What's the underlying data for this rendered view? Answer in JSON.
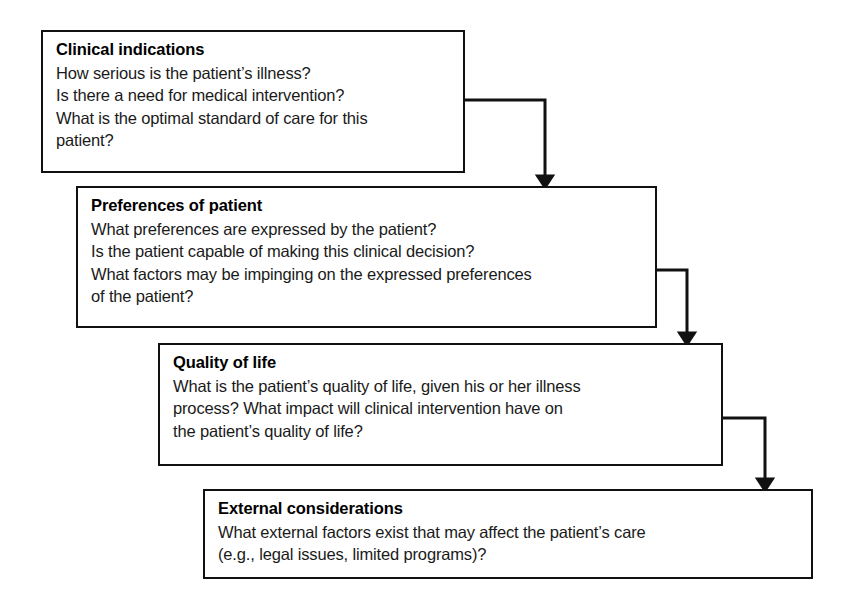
{
  "diagram": {
    "background_color": "#ffffff",
    "line_color": "#111111",
    "text_color": "#1a1a1a",
    "boxes": [
      {
        "id": "clinical-indications",
        "heading": "Clinical indications",
        "lines": [
          "How serious is the patient’s illness?",
          "Is there a need for medical intervention?",
          "What is the optimal standard of care for this",
          "patient?"
        ]
      },
      {
        "id": "preferences-of-patient",
        "heading": "Preferences of patient",
        "lines": [
          "What preferences are expressed by the patient?",
          "Is the patient capable of making this clinical decision?",
          "What factors may be impinging on the expressed preferences",
          "of the patient?"
        ]
      },
      {
        "id": "quality-of-life",
        "heading": "Quality of life",
        "lines": [
          "What is the patient’s quality of life, given his or her illness",
          "process? What impact will clinical intervention have on",
          "the patient’s quality of life?"
        ]
      },
      {
        "id": "external-considerations",
        "heading": "External considerations",
        "lines": [
          "What external factors exist that may affect the patient’s care",
          "(e.g., legal issues, limited programs)?"
        ]
      }
    ],
    "connectors": [
      {
        "id": "clinical-to-preferences",
        "from": "clinical-indications",
        "to": "preferences-of-patient",
        "style": "elbow-arrow"
      },
      {
        "id": "preferences-to-quality",
        "from": "preferences-of-patient",
        "to": "quality-of-life",
        "style": "elbow-arrow"
      },
      {
        "id": "quality-to-external",
        "from": "quality-of-life",
        "to": "external-considerations",
        "style": "elbow-arrow"
      }
    ]
  }
}
